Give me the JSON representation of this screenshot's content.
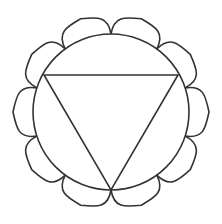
{
  "figure": {
    "stroke_color": "#333333",
    "background": "#ffffff",
    "center": [
      111,
      112
    ],
    "circle_radius": 78,
    "petal_count": 10,
    "petal_tip_radius": 98,
    "triangle": {
      "points": [
        [
          44,
          75
        ],
        [
          178,
          75
        ],
        [
          111,
          190
        ]
      ]
    }
  }
}
